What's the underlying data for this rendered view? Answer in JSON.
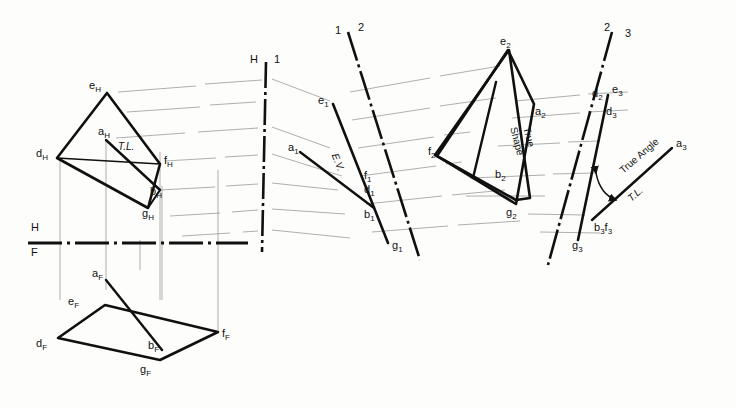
{
  "drawing": {
    "title": "Successive auxiliary views - true angle between line and plane",
    "background_color": "#fdfdfc",
    "object_line_color": "#101010",
    "projection_line_color": "#9a9a9a",
    "reference_line_color": "#101010"
  },
  "reference_lines": [
    {
      "id": "hf",
      "upper": "H",
      "lower": "F",
      "orientation": "horizontal"
    },
    {
      "id": "h1",
      "left": "H",
      "right": "1",
      "orientation": "vertical"
    },
    {
      "id": "12",
      "left": "1",
      "right": "2",
      "orientation": "inclined"
    },
    {
      "id": "23",
      "left": "2",
      "right": "3",
      "orientation": "inclined"
    }
  ],
  "views": {
    "top": {
      "name": "Top view (H)",
      "points": [
        "e_H",
        "d_H",
        "a_H",
        "f_H",
        "b_H",
        "g_H"
      ],
      "labels": {
        "e": {
          "base": "e",
          "sub": "H"
        },
        "d": {
          "base": "d",
          "sub": "H"
        },
        "a": {
          "base": "a",
          "sub": "H"
        },
        "f": {
          "base": "f",
          "sub": "H"
        },
        "b": {
          "base": "b",
          "sub": "H"
        },
        "g": {
          "base": "g",
          "sub": "H"
        }
      },
      "annotation": "T.L."
    },
    "front": {
      "name": "Front view (F)",
      "points": [
        "a_F",
        "e_F",
        "d_F",
        "b_F",
        "f_F",
        "g_F"
      ],
      "labels": {
        "a": {
          "base": "a",
          "sub": "F"
        },
        "e": {
          "base": "e",
          "sub": "F"
        },
        "d": {
          "base": "d",
          "sub": "F"
        },
        "b": {
          "base": "b",
          "sub": "F"
        },
        "f": {
          "base": "f",
          "sub": "F"
        },
        "g": {
          "base": "g",
          "sub": "F"
        }
      }
    },
    "aux1": {
      "name": "First auxiliary view (1) - edge view of plane",
      "points": [
        "e_1",
        "a_1",
        "f_1",
        "d_1",
        "b_1",
        "g_1"
      ],
      "labels": {
        "e": {
          "base": "e",
          "sub": "1"
        },
        "a": {
          "base": "a",
          "sub": "1"
        },
        "f": {
          "base": "f",
          "sub": "1"
        },
        "d": {
          "base": "d",
          "sub": "1"
        },
        "b": {
          "base": "b",
          "sub": "1"
        },
        "g": {
          "base": "g",
          "sub": "1"
        }
      },
      "annotation": "E.V."
    },
    "aux2": {
      "name": "Second auxiliary view (2) - true shape of plane",
      "points": [
        "e_2",
        "a_2",
        "d_2",
        "f_2",
        "b_2",
        "g_2"
      ],
      "labels": {
        "e": {
          "base": "e",
          "sub": "2"
        },
        "a": {
          "base": "a",
          "sub": "2"
        },
        "d": {
          "base": "d",
          "sub": "2"
        },
        "f": {
          "base": "f",
          "sub": "2"
        },
        "b": {
          "base": "b",
          "sub": "2"
        },
        "g": {
          "base": "g",
          "sub": "2"
        }
      },
      "annotation_line1": "True",
      "annotation_line2": "Shape"
    },
    "aux3": {
      "name": "Third auxiliary view (3) - true angle",
      "points": [
        "e_3",
        "d_3",
        "a_3",
        "b_3f_3",
        "g_3"
      ],
      "labels": {
        "e": {
          "base": "e",
          "sub": "3"
        },
        "d": {
          "base": "d",
          "sub": "3"
        },
        "a": {
          "base": "a",
          "sub": "3"
        },
        "bf": {
          "base": "b",
          "sub": "3",
          "base2": "f",
          "sub2": "3"
        },
        "g": {
          "base": "g",
          "sub": "3"
        }
      },
      "annotation_angle": "True Angle",
      "annotation_tl": "T.L."
    }
  }
}
